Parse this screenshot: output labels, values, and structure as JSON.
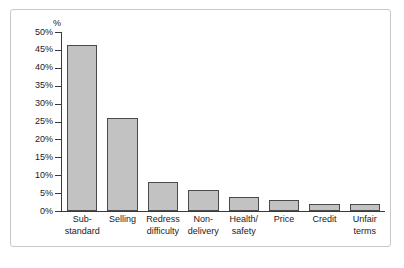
{
  "chart_data": {
    "type": "bar",
    "title": "",
    "subtitle": "",
    "xlabel": "",
    "ylabel": "%",
    "ylim": [
      0,
      50
    ],
    "ytick_step": 5,
    "grid": false,
    "legend": null,
    "axis_unit_label": "%",
    "categories": [
      "Sub-standard",
      "Selling",
      "Redress difficulty",
      "Non-delivery",
      "Health/safety",
      "Price",
      "Credit",
      "Unfair terms"
    ],
    "category_lines": [
      [
        "Sub-",
        "standard"
      ],
      [
        "Selling",
        ""
      ],
      [
        "Redress",
        "difficulty"
      ],
      [
        "Non-",
        "delivery"
      ],
      [
        "Health/",
        "safety"
      ],
      [
        "Price",
        ""
      ],
      [
        "Credit",
        ""
      ],
      [
        "Unfair",
        "terms"
      ]
    ],
    "values": [
      46.5,
      26,
      8,
      6,
      4,
      3,
      2,
      2
    ],
    "ytick_labels": [
      "50%",
      "45%",
      "40%",
      "35%",
      "30%",
      "25%",
      "20%",
      "15%",
      "10%",
      "5%",
      "0%"
    ],
    "ytick_values": [
      50,
      45,
      40,
      35,
      30,
      25,
      20,
      15,
      10,
      5,
      0
    ],
    "colors": {
      "bar_fill": "#c2c2c2",
      "bar_border": "#4a4a4a",
      "axis": "#3a3a3a",
      "text": "#1a1a1a",
      "frame": "#c8c8c8",
      "background": "#ffffff"
    }
  }
}
